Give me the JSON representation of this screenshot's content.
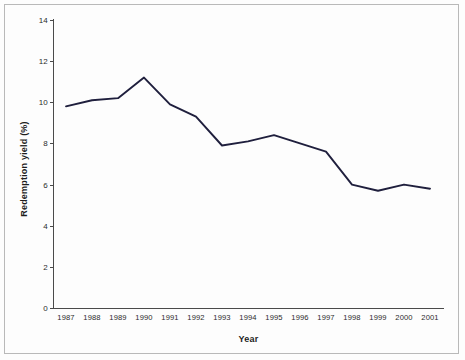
{
  "chart_data": {
    "type": "line",
    "title": "",
    "xlabel": "Year",
    "ylabel": "Redemption yield (%)",
    "categories": [
      "1987",
      "1988",
      "1989",
      "1990",
      "1991",
      "1992",
      "1993",
      "1994",
      "1995",
      "1996",
      "1997",
      "1998",
      "1999",
      "2000",
      "2001"
    ],
    "values": [
      9.8,
      10.1,
      10.2,
      11.2,
      9.9,
      9.3,
      7.9,
      8.1,
      8.4,
      8.0,
      7.6,
      6.0,
      5.7,
      6.0,
      5.8
    ],
    "series": [
      {
        "name": "Redemption yield",
        "color": "#1f1f3d",
        "values": [
          9.8,
          10.1,
          10.2,
          11.2,
          9.9,
          9.3,
          7.9,
          8.1,
          8.4,
          8.0,
          7.6,
          6.0,
          5.7,
          6.0,
          5.8
        ]
      }
    ],
    "ylim": [
      0,
      14
    ],
    "yticks": [
      0,
      2,
      4,
      6,
      8,
      10,
      12,
      14
    ],
    "ytick_labels": [
      "0",
      "2",
      "4",
      "6",
      "8",
      "10",
      "12",
      "14"
    ],
    "xtick_labels": [
      "1987",
      "1988",
      "1989",
      "1990",
      "1991",
      "1992",
      "1993",
      "1994",
      "1995",
      "1996",
      "1997",
      "1998",
      "1999",
      "2000",
      "2001"
    ],
    "grid": false,
    "legend": "none",
    "line_color": "#1f1f3d",
    "axis_color": "#4a4a4a",
    "background": "#fdfdfd"
  }
}
